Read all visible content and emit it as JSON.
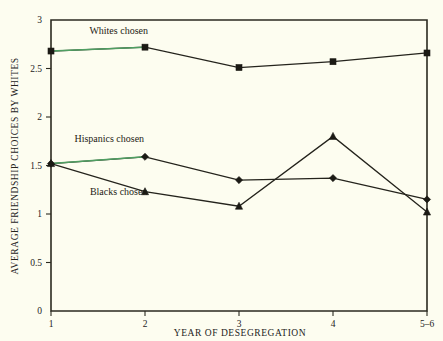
{
  "chart_data": {
    "type": "line",
    "title": "",
    "xlabel": "YEAR OF DESEGREGATION",
    "ylabel": "AVERAGE FRIENDSHIP CHOICES BY WHITES",
    "x": [
      1,
      2,
      3,
      4,
      5
    ],
    "xticklabels": [
      "1",
      "2",
      "3",
      "4",
      "5–6"
    ],
    "yticklabels": [
      "0",
      "0.5",
      "1",
      "1.5",
      "2",
      "2.5",
      "3"
    ],
    "ytickvalues": [
      0,
      0.5,
      1,
      1.5,
      2,
      2.5,
      3
    ],
    "ylim": [
      0,
      3
    ],
    "xlim": [
      1,
      5
    ],
    "grid": false,
    "legend_position": "inline-annotations",
    "series": [
      {
        "name": "Whites chosen",
        "label": "Whites chosen",
        "marker": "square",
        "values": [
          2.68,
          2.72,
          2.51,
          2.57,
          2.66
        ],
        "accent_segment": [
          0,
          1
        ],
        "accent_color": "#4f9f62",
        "color": "#24231c"
      },
      {
        "name": "Hispanics chosen",
        "label": "Hispanics chosen",
        "marker": "diamond",
        "values": [
          1.52,
          1.59,
          1.35,
          1.37,
          1.15
        ],
        "accent_segment": [
          0,
          1
        ],
        "accent_color": "#4f9f62",
        "color": "#24231c"
      },
      {
        "name": "Blacks chosen",
        "label": "Blacks chosen",
        "marker": "triangle",
        "values": [
          1.52,
          1.23,
          1.08,
          1.8,
          1.02
        ],
        "accent_segment": null,
        "accent_color": "#4f9f62",
        "color": "#24231c"
      }
    ],
    "annotations": [
      {
        "text": "Whites chosen",
        "x": 1.72,
        "y": 2.86
      },
      {
        "text": "Hispanics chosen",
        "x": 1.62,
        "y": 1.74
      },
      {
        "text": "Blacks chosen",
        "x": 1.72,
        "y": 1.2
      }
    ],
    "colors": {
      "background": "#fdfdf0",
      "axis": "#24231c",
      "line": "#24231c",
      "accent_green": "#4f9f62"
    }
  }
}
